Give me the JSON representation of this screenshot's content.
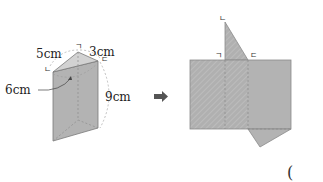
{
  "figure": {
    "prism": {
      "labels": {
        "edge_a": "5cm",
        "edge_b": "3cm",
        "edge_c": "6cm",
        "height": "9cm"
      },
      "vertex_marks": {
        "top_back": "ㄱ",
        "left": "ㄴ",
        "right": "ㄷ"
      }
    },
    "transform_arrow": "➡",
    "net": {
      "vertex_marks": {
        "apex": "ㄴ",
        "left_base": "ㄱ",
        "right_base": "ㄷ"
      }
    },
    "answer_paren": "("
  },
  "colors": {
    "face_fill": "#b3b3b3",
    "top_fill": "#cfcfcf",
    "edge": "#7a7a7a",
    "dashed": "#8c8c8c",
    "arrow": "#555555"
  }
}
